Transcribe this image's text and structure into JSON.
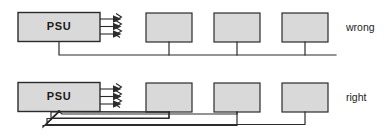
{
  "diagram": {
    "colors": {
      "box_fill": "#d9d9d9",
      "line": "#2b2b2b",
      "background": "#ffffff"
    },
    "rows": [
      {
        "id": "wrong-row",
        "verdict": "wrong",
        "psu_label": "PSU",
        "wiring_style": "daisy-chain",
        "load_count": 3,
        "arrow_count": 3
      },
      {
        "id": "right-row",
        "verdict": "right",
        "psu_label": "PSU",
        "wiring_style": "star-point",
        "load_count": 3,
        "arrow_count": 3
      }
    ]
  }
}
